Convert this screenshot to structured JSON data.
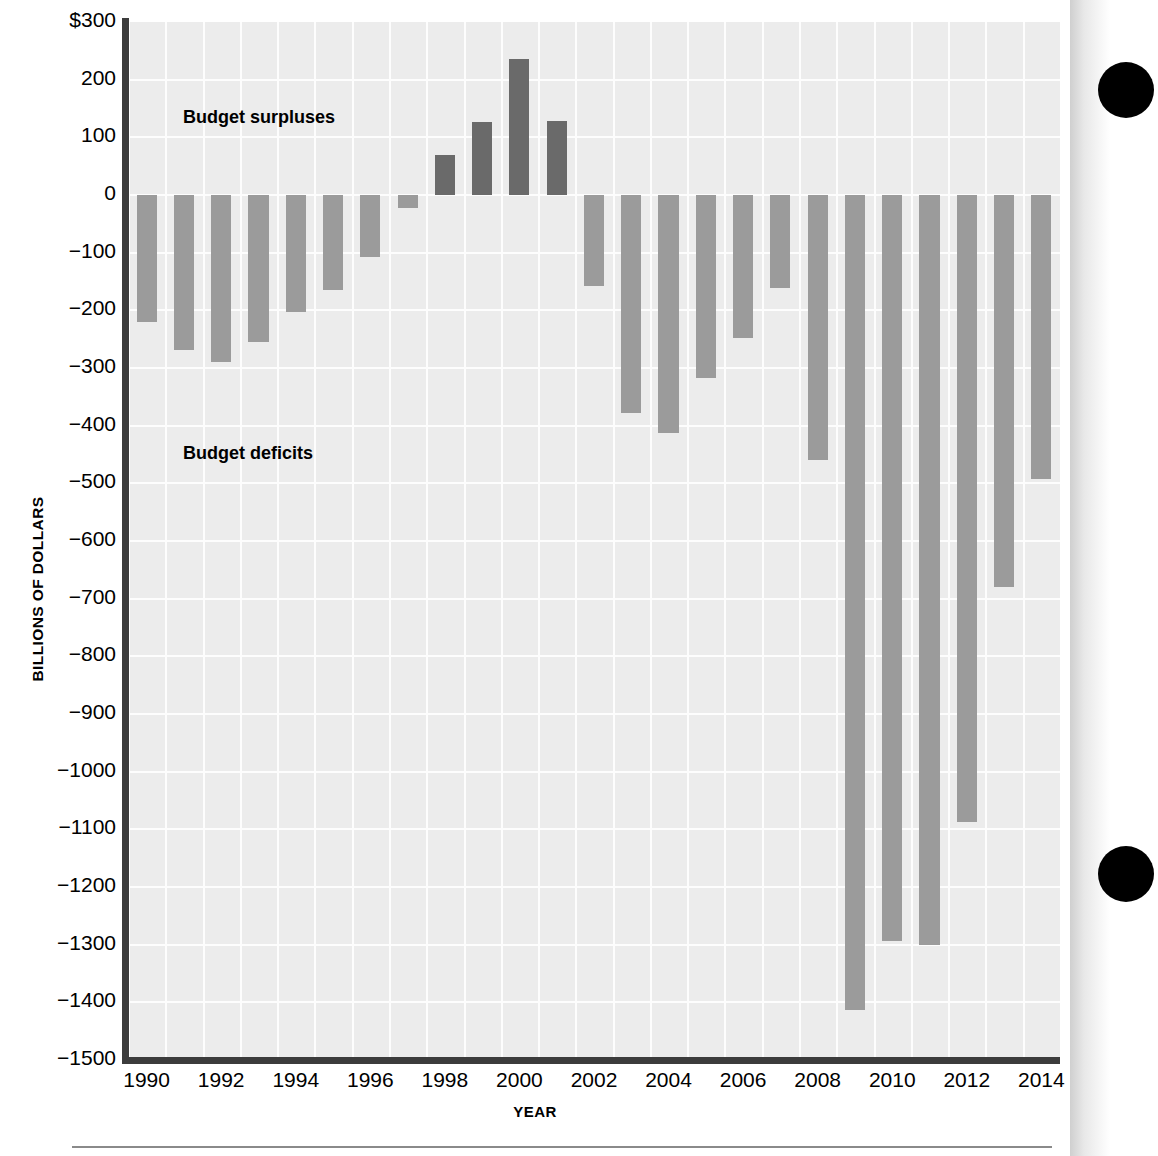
{
  "chart_data": {
    "type": "bar",
    "title": "",
    "xlabel": "YEAR",
    "ylabel": "BILLIONS OF DOLLARS",
    "ylim": [
      -1500,
      300
    ],
    "ytick_labels": [
      "$300",
      "200",
      "100",
      "0",
      "−100",
      "−200",
      "−300",
      "−400",
      "−500",
      "−600",
      "−700",
      "−800",
      "−900",
      "−1000",
      "−1100",
      "−1200",
      "−1300",
      "−1400",
      "−1500"
    ],
    "ytick_values": [
      300,
      200,
      100,
      0,
      -100,
      -200,
      -300,
      -400,
      -500,
      -600,
      -700,
      -800,
      -900,
      -1000,
      -1100,
      -1200,
      -1300,
      -1400,
      -1500
    ],
    "xtick_labels": [
      "1990",
      "1992",
      "1994",
      "1996",
      "1998",
      "2000",
      "2002",
      "2004",
      "2006",
      "2008",
      "2010",
      "2012",
      "2014"
    ],
    "grid": true,
    "legend_position": "none",
    "categories": [
      1990,
      1991,
      1992,
      1993,
      1994,
      1995,
      1996,
      1997,
      1998,
      1999,
      2000,
      2001,
      2002,
      2003,
      2004,
      2005,
      2006,
      2007,
      2008,
      2009,
      2010,
      2011,
      2012,
      2013,
      2014
    ],
    "values": [
      -221,
      -269,
      -290,
      -255,
      -203,
      -164,
      -107,
      -22,
      69,
      126,
      236,
      128,
      -158,
      -378,
      -413,
      -318,
      -248,
      -161,
      -459,
      -1413,
      -1294,
      -1300,
      -1087,
      -680,
      -492
    ],
    "annotations": [
      {
        "id": "surplus",
        "text": "Budget surpluses",
        "x": 1993.2,
        "y": 150
      },
      {
        "id": "deficit",
        "text": "Budget deficits",
        "x": 1993.2,
        "y": -432
      }
    ],
    "colors": {
      "deficit_bar": "#9b9b9b",
      "surplus_bar": "#6a6a6a",
      "plot_background": "#ececec",
      "gridline": "#fdfdfd",
      "axis": "#3c3c3c",
      "text": "#000000",
      "margin_dot": "#000000"
    }
  },
  "axis_titles": {
    "y": "BILLIONS OF DOLLARS",
    "x": "YEAR"
  },
  "annotations": {
    "surplus": "Budget surpluses",
    "deficit": "Budget deficits"
  }
}
